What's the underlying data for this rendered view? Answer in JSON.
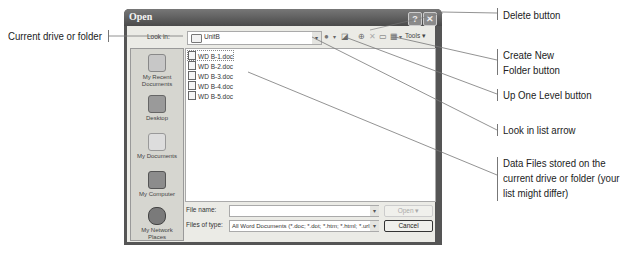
{
  "dialog": {
    "title": "Open",
    "help_button": "?",
    "close_button": "✕",
    "look_in_label": "Look in:",
    "look_in_value": "UnitB",
    "toolbar": {
      "back_icon": "●",
      "back_arrow": "▾",
      "up_one_level_icon": "◪",
      "search_web_icon": "⊕",
      "delete_icon": "✕",
      "create_folder_icon": "▭",
      "views_icon": "▦",
      "views_arrow": "▾",
      "tools_label": "Tools ▾"
    },
    "places": [
      {
        "label": "My Recent\nDocuments",
        "line1": "My Recent",
        "line2": "Documents"
      },
      {
        "label": "Desktop",
        "line1": "Desktop",
        "line2": ""
      },
      {
        "label": "My Documents",
        "line1": "My Documents",
        "line2": ""
      },
      {
        "label": "My Computer",
        "line1": "My Computer",
        "line2": ""
      },
      {
        "label": "My Network Places",
        "line1": "My Network",
        "line2": "Places"
      }
    ],
    "files": [
      "WD B-1.doc",
      "WD B-2.doc",
      "WD B-3.doc",
      "WD B-4.doc",
      "WD B-5.doc"
    ],
    "file_name_label": "File name:",
    "file_name_value": "",
    "files_of_type_label": "Files of type:",
    "files_of_type_value": "All Word Documents (*.doc; *.dot; *.htm; *.html; *.url; *",
    "open_button": "Open",
    "open_arrow": "▾",
    "cancel_button": "Cancel",
    "dropdown_arrow": "▾"
  },
  "callouts": {
    "current_drive": "Current drive or folder",
    "delete_button": "Delete button",
    "create_folder_1": "Create New",
    "create_folder_2": "Folder button",
    "up_one_level": "Up One Level button",
    "look_in_arrow": "Look in list arrow",
    "data_files_1": "Data Files stored on the",
    "data_files_2": "current drive or folder (your",
    "data_files_3": "list might differ)"
  }
}
